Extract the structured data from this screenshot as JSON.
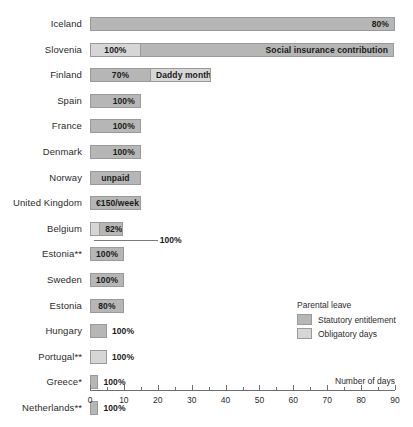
{
  "chart_data": {
    "type": "bar",
    "orientation": "horizontal",
    "stacked": true,
    "title": "",
    "xlabel": "Number of days",
    "ylabel": "",
    "xlim": [
      0,
      90
    ],
    "xticks": [
      0,
      10,
      20,
      30,
      40,
      50,
      60,
      70,
      80,
      90
    ],
    "xtick_labels": [
      "0",
      "10",
      "20",
      "30",
      "40",
      "50",
      "60",
      "70",
      "80",
      "90"
    ],
    "minor_tick_step": 5,
    "grid": false,
    "legend": {
      "title": "Parental leave",
      "position": "right-middle",
      "entries": [
        {
          "name": "Statutory entitlement",
          "key": "statutory",
          "color": "#b6b6b6"
        },
        {
          "name": "Obligatory days",
          "key": "obligatory",
          "color": "#d6d6d6"
        }
      ]
    },
    "categories": [
      "Iceland",
      "Slovenia",
      "Finland",
      "Spain",
      "France",
      "Denmark",
      "Norway",
      "United Kingdom",
      "Belgium",
      "Estonia**",
      "Sweden",
      "Estonia",
      "Hungary",
      "Portugal**",
      "Greece*",
      "Netherlands**"
    ],
    "series": [
      {
        "name": "Obligatory days",
        "key": "obligatory",
        "values": [
          0,
          15,
          0,
          0,
          0,
          0,
          0,
          0,
          3,
          0,
          0,
          0,
          0,
          5,
          0,
          0
        ]
      },
      {
        "name": "Statutory entitlement",
        "key": "statutory",
        "values": [
          90,
          75,
          18,
          0,
          0,
          0,
          0,
          0,
          7,
          0,
          0,
          0,
          5,
          0,
          2.5,
          2.5
        ]
      }
    ],
    "bars": [
      {
        "category": "Iceland",
        "segments": [
          {
            "type": "statutory",
            "start": 0,
            "end": 90,
            "label": "80%",
            "align": "right"
          }
        ]
      },
      {
        "category": "Slovenia",
        "segments": [
          {
            "type": "obligatory",
            "start": 0,
            "end": 15,
            "label": "100%",
            "align": "center"
          },
          {
            "type": "statutory",
            "start": 15,
            "end": 90,
            "label": "Social insurance contribution",
            "align": "right"
          }
        ]
      },
      {
        "category": "Finland",
        "segments": [
          {
            "type": "statutory",
            "start": 0,
            "end": 18,
            "label": "70%",
            "align": "center"
          },
          {
            "type": "obligatory",
            "start": 18,
            "end": 36,
            "label": "Daddy month",
            "align": "center"
          }
        ]
      },
      {
        "category": "Spain",
        "segments": [
          {
            "type": "statutory",
            "start": 0,
            "end": 15,
            "label": "100%",
            "align": "right"
          }
        ]
      },
      {
        "category": "France",
        "segments": [
          {
            "type": "statutory",
            "start": 0,
            "end": 15,
            "label": "100%",
            "align": "right"
          }
        ]
      },
      {
        "category": "Denmark",
        "segments": [
          {
            "type": "statutory",
            "start": 0,
            "end": 15,
            "label": "100%",
            "align": "right"
          }
        ]
      },
      {
        "category": "Norway",
        "segments": [
          {
            "type": "statutory",
            "start": 0,
            "end": 15,
            "label": "unpaid",
            "align": "center"
          }
        ]
      },
      {
        "category": "United Kingdom",
        "segments": [
          {
            "type": "statutory",
            "start": 0,
            "end": 15,
            "label": "€150/week",
            "align": "center"
          }
        ]
      },
      {
        "category": "Belgium",
        "segments": [
          {
            "type": "obligatory",
            "start": 0,
            "end": 3,
            "label": "",
            "align": "center"
          },
          {
            "type": "statutory",
            "start": 3,
            "end": 10,
            "label": "82%",
            "align": "center"
          }
        ],
        "callout": {
          "text": "100%",
          "at_day": 20
        }
      },
      {
        "category": "Estonia**",
        "segments": [
          {
            "type": "statutory",
            "start": 0,
            "end": 10,
            "label": "100%",
            "align": "center"
          }
        ]
      },
      {
        "category": "Sweden",
        "segments": [
          {
            "type": "statutory",
            "start": 0,
            "end": 10,
            "label": "100%",
            "align": "center"
          }
        ]
      },
      {
        "category": "Estonia",
        "segments": [
          {
            "type": "statutory",
            "start": 0,
            "end": 10,
            "label": "80%",
            "align": "center"
          }
        ]
      },
      {
        "category": "Hungary",
        "segments": [
          {
            "type": "statutory",
            "start": 0,
            "end": 5,
            "label": "",
            "align": "center"
          }
        ],
        "outside_label": "100%"
      },
      {
        "category": "Portugal**",
        "segments": [
          {
            "type": "obligatory",
            "start": 0,
            "end": 5,
            "label": "",
            "align": "center"
          }
        ],
        "outside_label": "100%"
      },
      {
        "category": "Greece*",
        "segments": [
          {
            "type": "statutory",
            "start": 0,
            "end": 2.5,
            "label": "",
            "align": "center"
          }
        ],
        "outside_label": "100%"
      },
      {
        "category": "Netherlands**",
        "segments": [
          {
            "type": "statutory",
            "start": 0,
            "end": 2.5,
            "label": "",
            "align": "center"
          }
        ],
        "outside_label": "100%"
      }
    ]
  }
}
